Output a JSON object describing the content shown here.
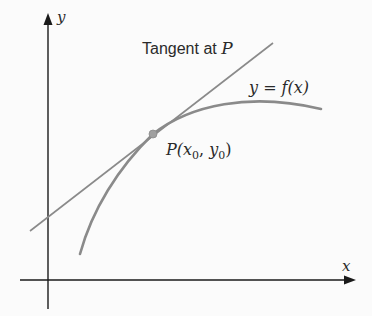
{
  "diagram": {
    "axes": {
      "x_label": "x",
      "y_label": "y"
    },
    "labels": {
      "tangent_prefix": "Tangent at ",
      "tangent_point": "P",
      "curve": "y = f(x)",
      "point_name": "P(",
      "point_x": "x",
      "point_x_sub": "0",
      "point_sep": ", ",
      "point_y": "y",
      "point_y_sub": "0",
      "point_close": ")"
    },
    "colors": {
      "axis": "#1a1a1a",
      "curve": "#8a8a8a",
      "tangent": "#8a8a8a",
      "point": "#a0a0a0",
      "text": "#2a2a2a",
      "background": "#fbfbfb"
    }
  }
}
